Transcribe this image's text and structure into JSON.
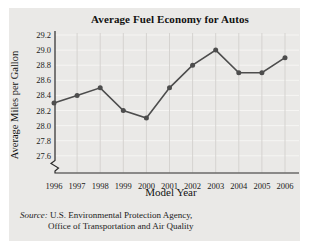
{
  "chart_data": {
    "type": "line",
    "title": "Average Fuel Economy for Autos",
    "xlabel": "Model Year",
    "ylabel": "Average Miles per Gallon",
    "x": [
      "1996",
      "1997",
      "1998",
      "1999",
      "2000",
      "2001",
      "2002",
      "2003",
      "2004",
      "2005",
      "2006"
    ],
    "values": [
      28.3,
      28.4,
      28.5,
      28.2,
      28.1,
      28.5,
      28.8,
      29.0,
      28.7,
      28.7,
      28.9
    ],
    "ylim": [
      27.6,
      29.2
    ],
    "ytick_step": 0.2,
    "ytick_labels": [
      "29.2",
      "29.0",
      "28.8",
      "28.6",
      "28.4",
      "28.2",
      "28.0",
      "27.8",
      "27.6"
    ],
    "axis_break_at_origin": true,
    "grid": "on",
    "legend": "none",
    "line_color": "#4d4d4d",
    "marker": "circle"
  },
  "source": {
    "label": "Source:",
    "line1": "U.S. Environmental Protection Agency,",
    "line2": "Office of Transportation and Air Quality"
  },
  "colors": {
    "page_bg": "#ffffff",
    "panel_bg": "#eae9e7",
    "h_grid": "#f6f5f3",
    "v_grid": "#d5d3d0",
    "axis": "#2b2b2b",
    "text": "#1a1a1a"
  }
}
